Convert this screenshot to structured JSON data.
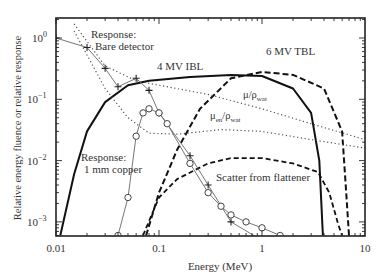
{
  "chart_data": {
    "type": "line",
    "title": "",
    "xlabel": "Energy (MeV)",
    "ylabel": "Relative energy fluence or relative response",
    "xscale": "log",
    "yscale": "log",
    "xlim": [
      0.01,
      10
    ],
    "ylim": [
      0.0006,
      2
    ],
    "x_ticks": [
      "0.01",
      "0.1",
      "1",
      "10"
    ],
    "y_ticks": [
      "10^-3",
      "10^-2",
      "10^-1",
      "10^0"
    ],
    "grid": false,
    "legend": "none (inline annotations)",
    "series": [
      {
        "name": "4 MV IBL",
        "style": "solid-thick",
        "points": [
          [
            0.011,
            0.0006
          ],
          [
            0.015,
            0.006
          ],
          [
            0.02,
            0.03
          ],
          [
            0.03,
            0.09
          ],
          [
            0.05,
            0.17
          ],
          [
            0.08,
            0.2
          ],
          [
            0.2,
            0.23
          ],
          [
            0.5,
            0.25
          ],
          [
            1,
            0.24
          ],
          [
            2,
            0.15
          ],
          [
            3,
            0.06
          ],
          [
            3.6,
            0.01
          ],
          [
            3.9,
            0.0006
          ]
        ]
      },
      {
        "name": "6 MV TBL",
        "style": "dashed-thick",
        "points": [
          [
            0.075,
            0.0006
          ],
          [
            0.1,
            0.003
          ],
          [
            0.15,
            0.015
          ],
          [
            0.25,
            0.07
          ],
          [
            0.5,
            0.22
          ],
          [
            1,
            0.28
          ],
          [
            2,
            0.25
          ],
          [
            4,
            0.15
          ],
          [
            6,
            0.03
          ],
          [
            6.5,
            0.004
          ],
          [
            7,
            0.0006
          ]
        ]
      },
      {
        "name": "Scatter from flattener",
        "style": "dashed",
        "points": [
          [
            0.07,
            0.0006
          ],
          [
            0.1,
            0.0025
          ],
          [
            0.15,
            0.005
          ],
          [
            0.3,
            0.009
          ],
          [
            0.5,
            0.011
          ],
          [
            1,
            0.011
          ],
          [
            2,
            0.009
          ],
          [
            3.5,
            0.0065
          ],
          [
            4.5,
            0.003
          ],
          [
            5.5,
            0.0009
          ],
          [
            6,
            0.0006
          ]
        ]
      },
      {
        "name": "μ/ρ_wat",
        "style": "dotted",
        "points": [
          [
            0.015,
            1.7
          ],
          [
            0.03,
            0.35
          ],
          [
            0.06,
            0.2
          ],
          [
            0.1,
            0.17
          ],
          [
            0.3,
            0.12
          ],
          [
            1,
            0.07
          ],
          [
            3,
            0.04
          ],
          [
            10,
            0.022
          ]
        ]
      },
      {
        "name": "μ_en/ρ_wat",
        "style": "dotted",
        "points": [
          [
            0.015,
            1.3
          ],
          [
            0.03,
            0.15
          ],
          [
            0.05,
            0.05
          ],
          [
            0.08,
            0.028
          ],
          [
            0.15,
            0.027
          ],
          [
            0.4,
            0.032
          ],
          [
            1,
            0.03
          ],
          [
            3,
            0.022
          ],
          [
            10,
            0.016
          ]
        ]
      },
      {
        "name": "Response: Bare detector",
        "style": "thin-solid-plus-markers",
        "points": [
          [
            0.01,
            1.0
          ],
          [
            0.02,
            0.7
          ],
          [
            0.03,
            0.32
          ],
          [
            0.04,
            0.16
          ],
          [
            0.06,
            0.22
          ],
          [
            0.08,
            0.14
          ],
          [
            0.1,
            0.06
          ],
          [
            0.2,
            0.012
          ],
          [
            0.3,
            0.004
          ],
          [
            0.5,
            0.001
          ],
          [
            1,
            0.0005
          ]
        ]
      },
      {
        "name": "Response: 1 mm copper",
        "style": "thin-solid-circle-markers",
        "points": [
          [
            0.04,
            0.0006
          ],
          [
            0.05,
            0.0025
          ],
          [
            0.06,
            0.025
          ],
          [
            0.07,
            0.06
          ],
          [
            0.08,
            0.07
          ],
          [
            0.1,
            0.06
          ],
          [
            0.12,
            0.04
          ],
          [
            0.2,
            0.009
          ],
          [
            0.3,
            0.003
          ],
          [
            0.4,
            0.0018
          ],
          [
            0.5,
            0.0013
          ],
          [
            0.7,
            0.001
          ],
          [
            1,
            0.0008
          ],
          [
            1.5,
            0.0006
          ]
        ]
      }
    ],
    "annotations": [
      "Response: Bare detector",
      "4 MV IBL",
      "6 MV TBL",
      "μ/ρwat",
      "μen/ρwat",
      "Response: 1 mm copper",
      "Scatter from flattener"
    ]
  },
  "labels": {
    "ylabel": "Relative energy fluence or relative response",
    "xlabel": "Energy (MeV)",
    "x_ticks": [
      "0.01",
      "0.1",
      "1",
      "10"
    ],
    "bare1": "Response:",
    "bare2": "Bare detector",
    "ibl": "4 MV IBL",
    "tbl": "6 MV TBL",
    "mu": "μ/ρ",
    "mu_sub": "wat",
    "muen": "μ",
    "muen_sub1": "en",
    "muen_mid": "/ρ",
    "muen_sub2": "wat",
    "cu1": "Response:",
    "cu2": "1 mm copper",
    "scatter": "Scatter from flattener"
  }
}
